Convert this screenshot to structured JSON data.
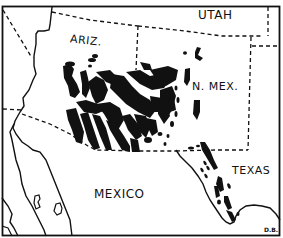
{
  "map": {
    "type": "range-distribution",
    "style": "black-and-white line drawing",
    "colors": {
      "background": "#ffffff",
      "ink": "#111111"
    },
    "labels": {
      "utah": "UTAH",
      "arizona": "ARIZ.",
      "new_mexico": "N. MEX.",
      "texas": "TEXAS",
      "mexico": "MEXICO"
    },
    "signature": "D.B.",
    "legend": {
      "boundaries": "dashed lines = state / international borders",
      "coast": "solid lines = coastline (Gulf of California, Baja California)",
      "range": "black patches = distribution areas"
    }
  }
}
